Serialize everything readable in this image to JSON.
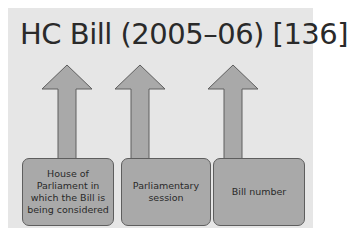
{
  "title": "HC Bill (2005–06) [136]",
  "diagram": {
    "arrows": [
      {
        "icon": "arrow-up-icon",
        "points_to": "HC"
      },
      {
        "icon": "arrow-up-icon",
        "points_to": "(2005–06)"
      },
      {
        "icon": "arrow-up-icon",
        "points_to": "[136]"
      }
    ],
    "boxes": [
      {
        "label": "House of Parliament in which the Bill is being considered"
      },
      {
        "label": "Parliamentary session"
      },
      {
        "label": "Bill number"
      }
    ]
  },
  "colors": {
    "panel": "#e6e6e6",
    "shape_fill": "#a9a9a9",
    "shape_stroke": "#5e5e5e",
    "text": "#2a2a2a"
  }
}
